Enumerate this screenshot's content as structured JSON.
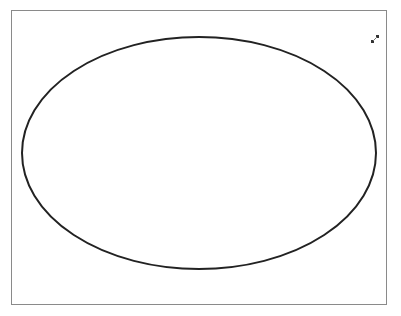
{
  "canvas": {
    "background": "#ffffff",
    "border_color": "#8a8a8a"
  },
  "shape": {
    "type": "ellipse",
    "cx": 199,
    "cy": 153,
    "rx": 177,
    "ry": 116,
    "stroke": "#222222",
    "stroke_width": 2,
    "fill": "none"
  },
  "icons": {
    "resize_handle": "resize-diagonal-icon"
  }
}
